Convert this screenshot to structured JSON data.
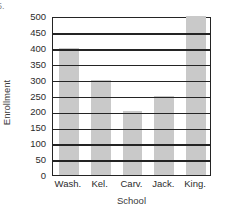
{
  "item_number": "5.",
  "chart_data": {
    "type": "bar",
    "title": "",
    "xlabel": "School",
    "ylabel": "Enrollment",
    "categories": [
      "Wash.",
      "Kel.",
      "Carv.",
      "Jack.",
      "King."
    ],
    "values": [
      400,
      300,
      200,
      250,
      500
    ],
    "ylim": [
      0,
      500
    ],
    "ytick_step": 50,
    "yticks": [
      0,
      50,
      100,
      150,
      200,
      250,
      300,
      350,
      400,
      450,
      500
    ],
    "ytick_labels": [
      "0",
      "50",
      "100",
      "150",
      "200",
      "250",
      "300",
      "350",
      "400",
      "450",
      "500"
    ],
    "grid": true,
    "grid_axis": "y",
    "legend": false,
    "bar_color": "#c9c9c9",
    "axis_color": "#242424",
    "background_color": "#ffffff"
  }
}
